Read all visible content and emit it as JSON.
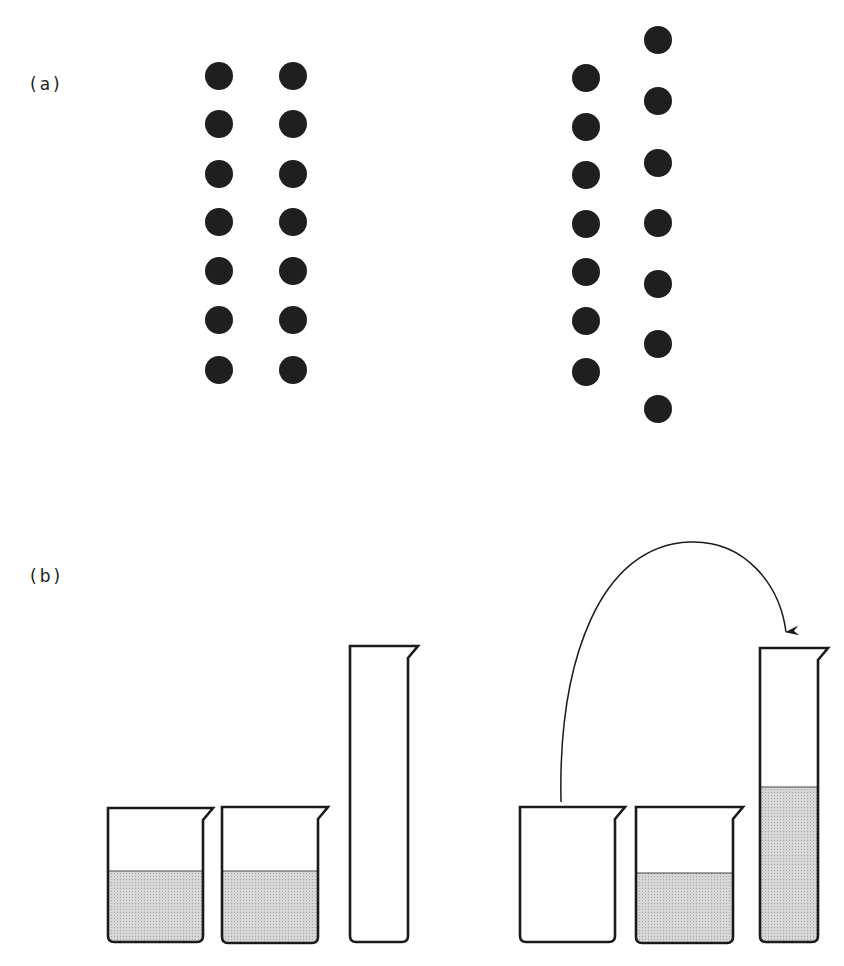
{
  "figure": {
    "panel_a": {
      "label": "(a)",
      "left_arrangement": {
        "description": "two aligned columns of seven dots",
        "columns": [
          {
            "x": 219,
            "dots_y": [
              76,
              124,
              174,
              222,
              271,
              320,
              370
            ]
          },
          {
            "x": 293,
            "dots_y": [
              76,
              124,
              174,
              222,
              271,
              320,
              370
            ]
          }
        ]
      },
      "right_arrangement": {
        "description": "same two columns of seven dots but the second column spread out",
        "columns": [
          {
            "x": 586,
            "dots_y": [
              78,
              127,
              175,
              224,
              272,
              321,
              372
            ]
          },
          {
            "x": 658,
            "dots_y": [
              40,
              101,
              163,
              223,
              284,
              344,
              409
            ]
          }
        ]
      },
      "dot_radius": 14,
      "dot_color": "#1f1f1f"
    },
    "panel_b": {
      "label": "(b)",
      "left_set": [
        {
          "type": "beaker",
          "x": 108,
          "top": 808,
          "width": 95,
          "bottom": 942,
          "liquid_top": 871
        },
        {
          "type": "beaker",
          "x": 222,
          "top": 807,
          "width": 96,
          "bottom": 943,
          "liquid_top": 871
        },
        {
          "type": "cylinder",
          "x": 350,
          "top": 646,
          "width": 58,
          "bottom": 942,
          "liquid_top": null
        }
      ],
      "right_set": [
        {
          "type": "beaker",
          "x": 520,
          "top": 807,
          "width": 95,
          "bottom": 942,
          "liquid_top": null
        },
        {
          "type": "beaker",
          "x": 636,
          "top": 807,
          "width": 97,
          "bottom": 943,
          "liquid_top": 873
        },
        {
          "type": "cylinder",
          "x": 760,
          "top": 648,
          "width": 58,
          "bottom": 942,
          "liquid_top": 787
        }
      ],
      "arrow": {
        "from": "first beaker (right set)",
        "to": "graduated cylinder (right set)"
      },
      "liquid_color": "#cfcfcf",
      "line_color": "#1a1a1a"
    }
  }
}
